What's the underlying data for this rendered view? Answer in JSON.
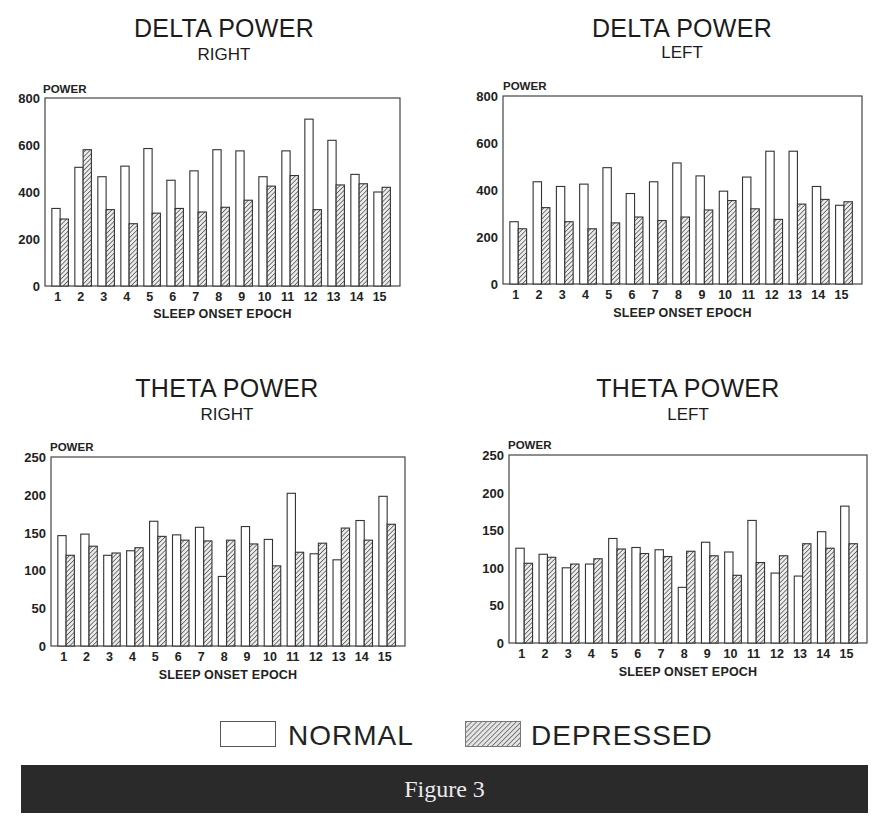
{
  "figure": {
    "footer_label": "Figure 3",
    "legend": {
      "normal_label": "NORMAL",
      "depressed_label": "DEPRESSED"
    },
    "colors": {
      "normal_fill": "#ffffff",
      "depressed_hatch": "#3a3a3a",
      "outline": "#333333",
      "footer_bg": "#2a2a2a",
      "footer_text": "#eaeaea"
    }
  },
  "chart_data": [
    {
      "id": "delta_right",
      "type": "bar",
      "title": "DELTA POWER",
      "subtitle": "RIGHT",
      "xlabel": "SLEEP ONSET EPOCH",
      "ylabel": "POWER",
      "ylim": [
        0,
        800
      ],
      "yticks": [
        0,
        200,
        400,
        600,
        800
      ],
      "grid": false,
      "categories": [
        "1",
        "2",
        "3",
        "4",
        "5",
        "6",
        "7",
        "8",
        "9",
        "10",
        "11",
        "12",
        "13",
        "14",
        "15"
      ],
      "series": [
        {
          "name": "NORMAL",
          "values": [
            330,
            505,
            465,
            510,
            585,
            450,
            490,
            580,
            575,
            465,
            575,
            710,
            620,
            475,
            400
          ]
        },
        {
          "name": "DEPRESSED",
          "values": [
            285,
            580,
            325,
            265,
            310,
            330,
            315,
            335,
            365,
            425,
            470,
            325,
            430,
            435,
            420
          ]
        }
      ]
    },
    {
      "id": "delta_left",
      "type": "bar",
      "title": "DELTA POWER",
      "subtitle": "LEFT",
      "xlabel": "SLEEP ONSET EPOCH",
      "ylabel": "POWER",
      "ylim": [
        0,
        800
      ],
      "yticks": [
        0,
        200,
        400,
        600,
        800
      ],
      "grid": false,
      "categories": [
        "1",
        "2",
        "3",
        "4",
        "5",
        "6",
        "7",
        "8",
        "9",
        "10",
        "11",
        "12",
        "13",
        "14",
        "15"
      ],
      "series": [
        {
          "name": "NORMAL",
          "values": [
            265,
            435,
            415,
            425,
            495,
            385,
            435,
            515,
            460,
            395,
            455,
            565,
            565,
            415,
            335
          ]
        },
        {
          "name": "DEPRESSED",
          "values": [
            235,
            325,
            265,
            235,
            260,
            285,
            270,
            285,
            315,
            355,
            320,
            275,
            340,
            360,
            350
          ]
        }
      ]
    },
    {
      "id": "theta_right",
      "type": "bar",
      "title": "THETA POWER",
      "subtitle": "RIGHT",
      "xlabel": "SLEEP ONSET EPOCH",
      "ylabel": "POWER",
      "ylim": [
        0,
        250
      ],
      "yticks": [
        0,
        50,
        100,
        150,
        200,
        250
      ],
      "grid": false,
      "categories": [
        "1",
        "2",
        "3",
        "4",
        "5",
        "6",
        "7",
        "8",
        "9",
        "10",
        "11",
        "12",
        "13",
        "14",
        "15"
      ],
      "series": [
        {
          "name": "NORMAL",
          "values": [
            146,
            148,
            120,
            126,
            165,
            147,
            157,
            92,
            158,
            141,
            202,
            122,
            114,
            166,
            198
          ]
        },
        {
          "name": "DEPRESSED",
          "values": [
            120,
            132,
            123,
            130,
            145,
            140,
            139,
            140,
            135,
            106,
            124,
            136,
            156,
            140,
            161
          ]
        }
      ]
    },
    {
      "id": "theta_left",
      "type": "bar",
      "title": "THETA POWER",
      "subtitle": "LEFT",
      "xlabel": "SLEEP ONSET EPOCH",
      "ylabel": "POWER",
      "ylim": [
        0,
        250
      ],
      "yticks": [
        0,
        50,
        100,
        150,
        200,
        250
      ],
      "grid": false,
      "categories": [
        "1",
        "2",
        "3",
        "4",
        "5",
        "6",
        "7",
        "8",
        "9",
        "10",
        "11",
        "12",
        "13",
        "14",
        "15"
      ],
      "series": [
        {
          "name": "NORMAL",
          "values": [
            126,
            118,
            100,
            105,
            139,
            127,
            124,
            74,
            134,
            121,
            163,
            93,
            89,
            148,
            182
          ]
        },
        {
          "name": "DEPRESSED",
          "values": [
            106,
            114,
            105,
            112,
            125,
            119,
            115,
            122,
            116,
            90,
            107,
            116,
            132,
            126,
            132
          ]
        }
      ]
    }
  ]
}
